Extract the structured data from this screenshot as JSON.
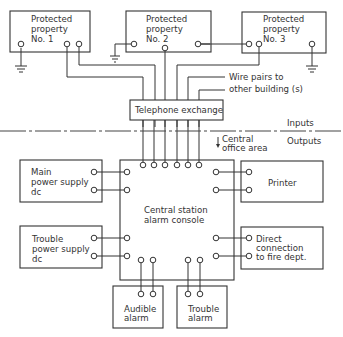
{
  "diagram": {
    "properties": [
      {
        "line1": "Protected",
        "line2": "property",
        "line3": "No. 1"
      },
      {
        "line1": "Protected",
        "line2": "property",
        "line3": "No. 2"
      },
      {
        "line1": "Protected",
        "line2": "property",
        "line3": "No. 3"
      }
    ],
    "wire_pairs_label": {
      "line1": "Wire pairs to",
      "line2": "other building (s)"
    },
    "telephone_exchange": "Telephone exchange",
    "divider": {
      "inputs": "Inputs",
      "outputs": "Outputs",
      "area_line1": "Central",
      "area_line2": "office area"
    },
    "console": {
      "line1": "Central station",
      "line2": "alarm console"
    },
    "main_power": {
      "line1": "Main",
      "line2": "power supply",
      "line3": "dc"
    },
    "trouble_power": {
      "line1": "Trouble",
      "line2": "power supply",
      "line3": "dc"
    },
    "printer": "Printer",
    "fire_dept": {
      "line1": "Direct",
      "line2": "connection",
      "line3": "to fire dept."
    },
    "audible_alarm": {
      "line1": "Audible",
      "line2": "alarm"
    },
    "trouble_alarm": {
      "line1": "Trouble",
      "line2": "alarm"
    }
  }
}
